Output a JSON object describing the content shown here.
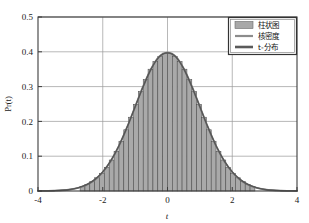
{
  "chart_data": {
    "type": "area",
    "title": "",
    "xlabel": "t",
    "ylabel": "Pr(t)",
    "xlim": [
      -4,
      4
    ],
    "ylim": [
      0,
      0.5
    ],
    "xticks": [
      "-4",
      "-2",
      "0",
      "2",
      "4"
    ],
    "xtick_values": [
      -4,
      -2,
      0,
      2,
      4
    ],
    "yticks": [
      "0",
      "0.1",
      "0.2",
      "0.3",
      "0.4",
      "0.5"
    ],
    "ytick_values": [
      0,
      0.1,
      0.2,
      0.3,
      0.4,
      0.5
    ],
    "grid": true,
    "legend_position": "top-right",
    "legend": [
      {
        "label": "柱状图",
        "marker": "patch",
        "color": "#a8a8a8"
      },
      {
        "label": "核密度",
        "marker": "line",
        "color": "#8c8c8c"
      },
      {
        "label": "t-分布",
        "marker": "line",
        "color": "#5a5a5a"
      }
    ],
    "series": [
      {
        "name": "柱状图",
        "type": "histogram",
        "bin_width": 0.15,
        "bin_centers": [
          -2.625,
          -2.475,
          -2.325,
          -2.175,
          -2.025,
          -1.875,
          -1.725,
          -1.575,
          -1.425,
          -1.275,
          -1.125,
          -0.975,
          -0.825,
          -0.675,
          -0.525,
          -0.375,
          -0.225,
          -0.075,
          0.075,
          0.225,
          0.375,
          0.525,
          0.675,
          0.825,
          0.975,
          1.125,
          1.275,
          1.425,
          1.575,
          1.725,
          1.875,
          2.025,
          2.175,
          2.325,
          2.475,
          2.625
        ],
        "values": [
          0.013,
          0.019,
          0.027,
          0.038,
          0.051,
          0.068,
          0.089,
          0.114,
          0.143,
          0.176,
          0.212,
          0.249,
          0.286,
          0.32,
          0.35,
          0.372,
          0.387,
          0.396,
          0.396,
          0.387,
          0.372,
          0.35,
          0.32,
          0.286,
          0.249,
          0.212,
          0.176,
          0.143,
          0.114,
          0.089,
          0.068,
          0.051,
          0.038,
          0.027,
          0.019,
          0.013
        ]
      },
      {
        "name": "核密度",
        "type": "line",
        "x": [
          -4,
          -3.75,
          -3.5,
          -3.25,
          -3,
          -2.75,
          -2.5,
          -2.25,
          -2,
          -1.75,
          -1.5,
          -1.25,
          -1,
          -0.75,
          -0.5,
          -0.25,
          0,
          0.25,
          0.5,
          0.75,
          1,
          1.25,
          1.5,
          1.75,
          2,
          2.25,
          2.5,
          2.75,
          3,
          3.25,
          3.5,
          3.75,
          4
        ],
        "y": [
          0.0001,
          0.0004,
          0.0009,
          0.002,
          0.0044,
          0.0091,
          0.0175,
          0.0317,
          0.054,
          0.0863,
          0.1295,
          0.1826,
          0.242,
          0.3011,
          0.3521,
          0.3867,
          0.3975,
          0.3867,
          0.3521,
          0.3011,
          0.242,
          0.1826,
          0.1295,
          0.0863,
          0.054,
          0.0317,
          0.0175,
          0.0091,
          0.0044,
          0.002,
          0.0009,
          0.0004,
          0.0001
        ]
      },
      {
        "name": "t-分布",
        "type": "line",
        "x": [
          -4,
          -3.75,
          -3.5,
          -3.25,
          -3,
          -2.75,
          -2.5,
          -2.25,
          -2,
          -1.75,
          -1.5,
          -1.25,
          -1,
          -0.75,
          -0.5,
          -0.25,
          0,
          0.25,
          0.5,
          0.75,
          1,
          1.25,
          1.5,
          1.75,
          2,
          2.25,
          2.5,
          2.75,
          3,
          3.25,
          3.5,
          3.75,
          4
        ],
        "y": [
          0.0002,
          0.0005,
          0.0011,
          0.0024,
          0.0049,
          0.0098,
          0.0184,
          0.0327,
          0.0551,
          0.0872,
          0.1303,
          0.1831,
          0.242,
          0.3006,
          0.3515,
          0.3861,
          0.397,
          0.3861,
          0.3515,
          0.3006,
          0.242,
          0.1831,
          0.1303,
          0.0872,
          0.0551,
          0.0327,
          0.0184,
          0.0098,
          0.0049,
          0.0024,
          0.0011,
          0.0005,
          0.0002
        ]
      }
    ],
    "colors": {
      "histogram_fill": "#a9a9a9",
      "histogram_edge": "#4a4a4a",
      "kde_line": "#7d7d7d",
      "tdist_line": "#555555",
      "grid": "#9a9a9a",
      "axis": "#3c3c3c",
      "background": "#ffffff"
    }
  }
}
